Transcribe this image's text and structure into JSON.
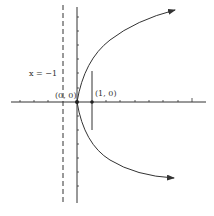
{
  "diagram": {
    "labels": {
      "directrix": "x = −1",
      "vertex": "(0, 0)",
      "focus": "(1, 0)"
    },
    "elements": {
      "x_axis": "horizontal axis with tick marks",
      "y_axis": "vertical axis with tick marks",
      "directrix_line": "dashed vertical line at x = -1",
      "parabola": "opening to the right, arrows at both ends",
      "latus_rectum": "vertical segment through focus",
      "vertex_point": "filled dot at origin",
      "focus_point": "filled dot at (1, 0)"
    },
    "colors": {
      "stroke": "#333333",
      "background": "#ffffff"
    }
  }
}
